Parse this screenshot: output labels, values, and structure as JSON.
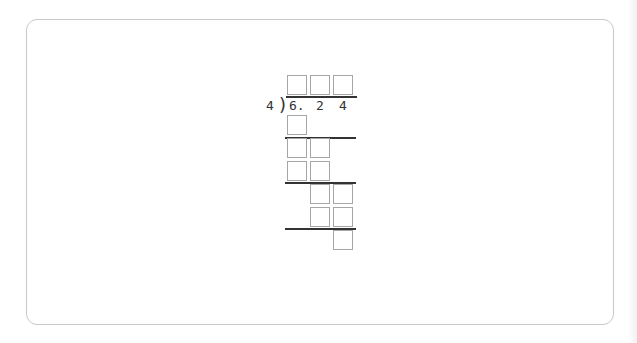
{
  "problem": {
    "type": "long-division",
    "divisor": "4",
    "dividend_digits": [
      "6.",
      "2",
      "4"
    ],
    "bracket_glyph": ")",
    "quotient_boxes": 3,
    "work_rows": [
      {
        "row": 1,
        "boxes": 1,
        "columns": [
          0
        ]
      },
      {
        "row": 2,
        "boxes": 2,
        "columns": [
          0,
          1
        ]
      },
      {
        "row": 3,
        "boxes": 2,
        "columns": [
          0,
          1
        ]
      },
      {
        "row": 4,
        "boxes": 2,
        "columns": [
          1,
          2
        ]
      },
      {
        "row": 5,
        "boxes": 2,
        "columns": [
          1,
          2
        ]
      },
      {
        "row": 6,
        "boxes": 1,
        "columns": [
          2
        ]
      }
    ],
    "colors": {
      "box_border": "#a6a6a6",
      "rule_line": "#333333",
      "card_border": "#c9c9c9",
      "text": "#333333"
    }
  }
}
